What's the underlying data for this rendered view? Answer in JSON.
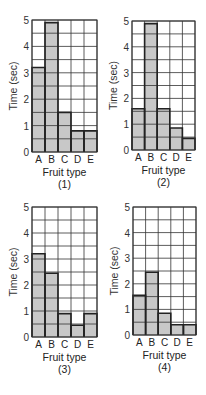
{
  "chart_data": [
    {
      "type": "bar",
      "title": "(1)",
      "xlabel": "Fruit type",
      "ylabel": "Time (sec)",
      "categories": [
        "A",
        "B",
        "C",
        "D",
        "E"
      ],
      "values": [
        3.2,
        4.9,
        1.5,
        0.8,
        0.8
      ],
      "ylim": [
        0,
        5
      ],
      "yticks": [
        0,
        1,
        2,
        3,
        4,
        5
      ],
      "grid": true,
      "grid_step": 0.5
    },
    {
      "type": "bar",
      "title": "(2)",
      "xlabel": "Fruit type",
      "ylabel": "Time (sec)",
      "categories": [
        "A",
        "B",
        "C",
        "D",
        "E"
      ],
      "values": [
        1.6,
        4.9,
        1.6,
        0.85,
        0.45
      ],
      "ylim": [
        0,
        5
      ],
      "yticks": [
        0,
        1,
        2,
        3,
        4,
        5
      ],
      "grid": true,
      "grid_step": 0.5
    },
    {
      "type": "bar",
      "title": "(3)",
      "xlabel": "Fruit type",
      "ylabel": "Time (sec)",
      "categories": [
        "A",
        "B",
        "C",
        "D",
        "E"
      ],
      "values": [
        3.2,
        2.45,
        0.9,
        0.45,
        0.9
      ],
      "ylim": [
        0,
        5
      ],
      "yticks": [
        0,
        1,
        2,
        3,
        4,
        5
      ],
      "grid": true,
      "grid_step": 0.5
    },
    {
      "type": "bar",
      "title": "(4)",
      "xlabel": "Fruit type",
      "ylabel": "Time (sec)",
      "categories": [
        "A",
        "B",
        "C",
        "D",
        "E"
      ],
      "values": [
        1.55,
        2.45,
        0.85,
        0.4,
        0.4
      ],
      "ylim": [
        0,
        5
      ],
      "yticks": [
        0,
        1,
        2,
        3,
        4,
        5
      ],
      "grid": true,
      "grid_step": 0.5
    }
  ],
  "colors": {
    "bar_fill": "#c8c8c8",
    "bar_edge": "#222222",
    "grid": "#333333",
    "background": "#ffffff"
  }
}
